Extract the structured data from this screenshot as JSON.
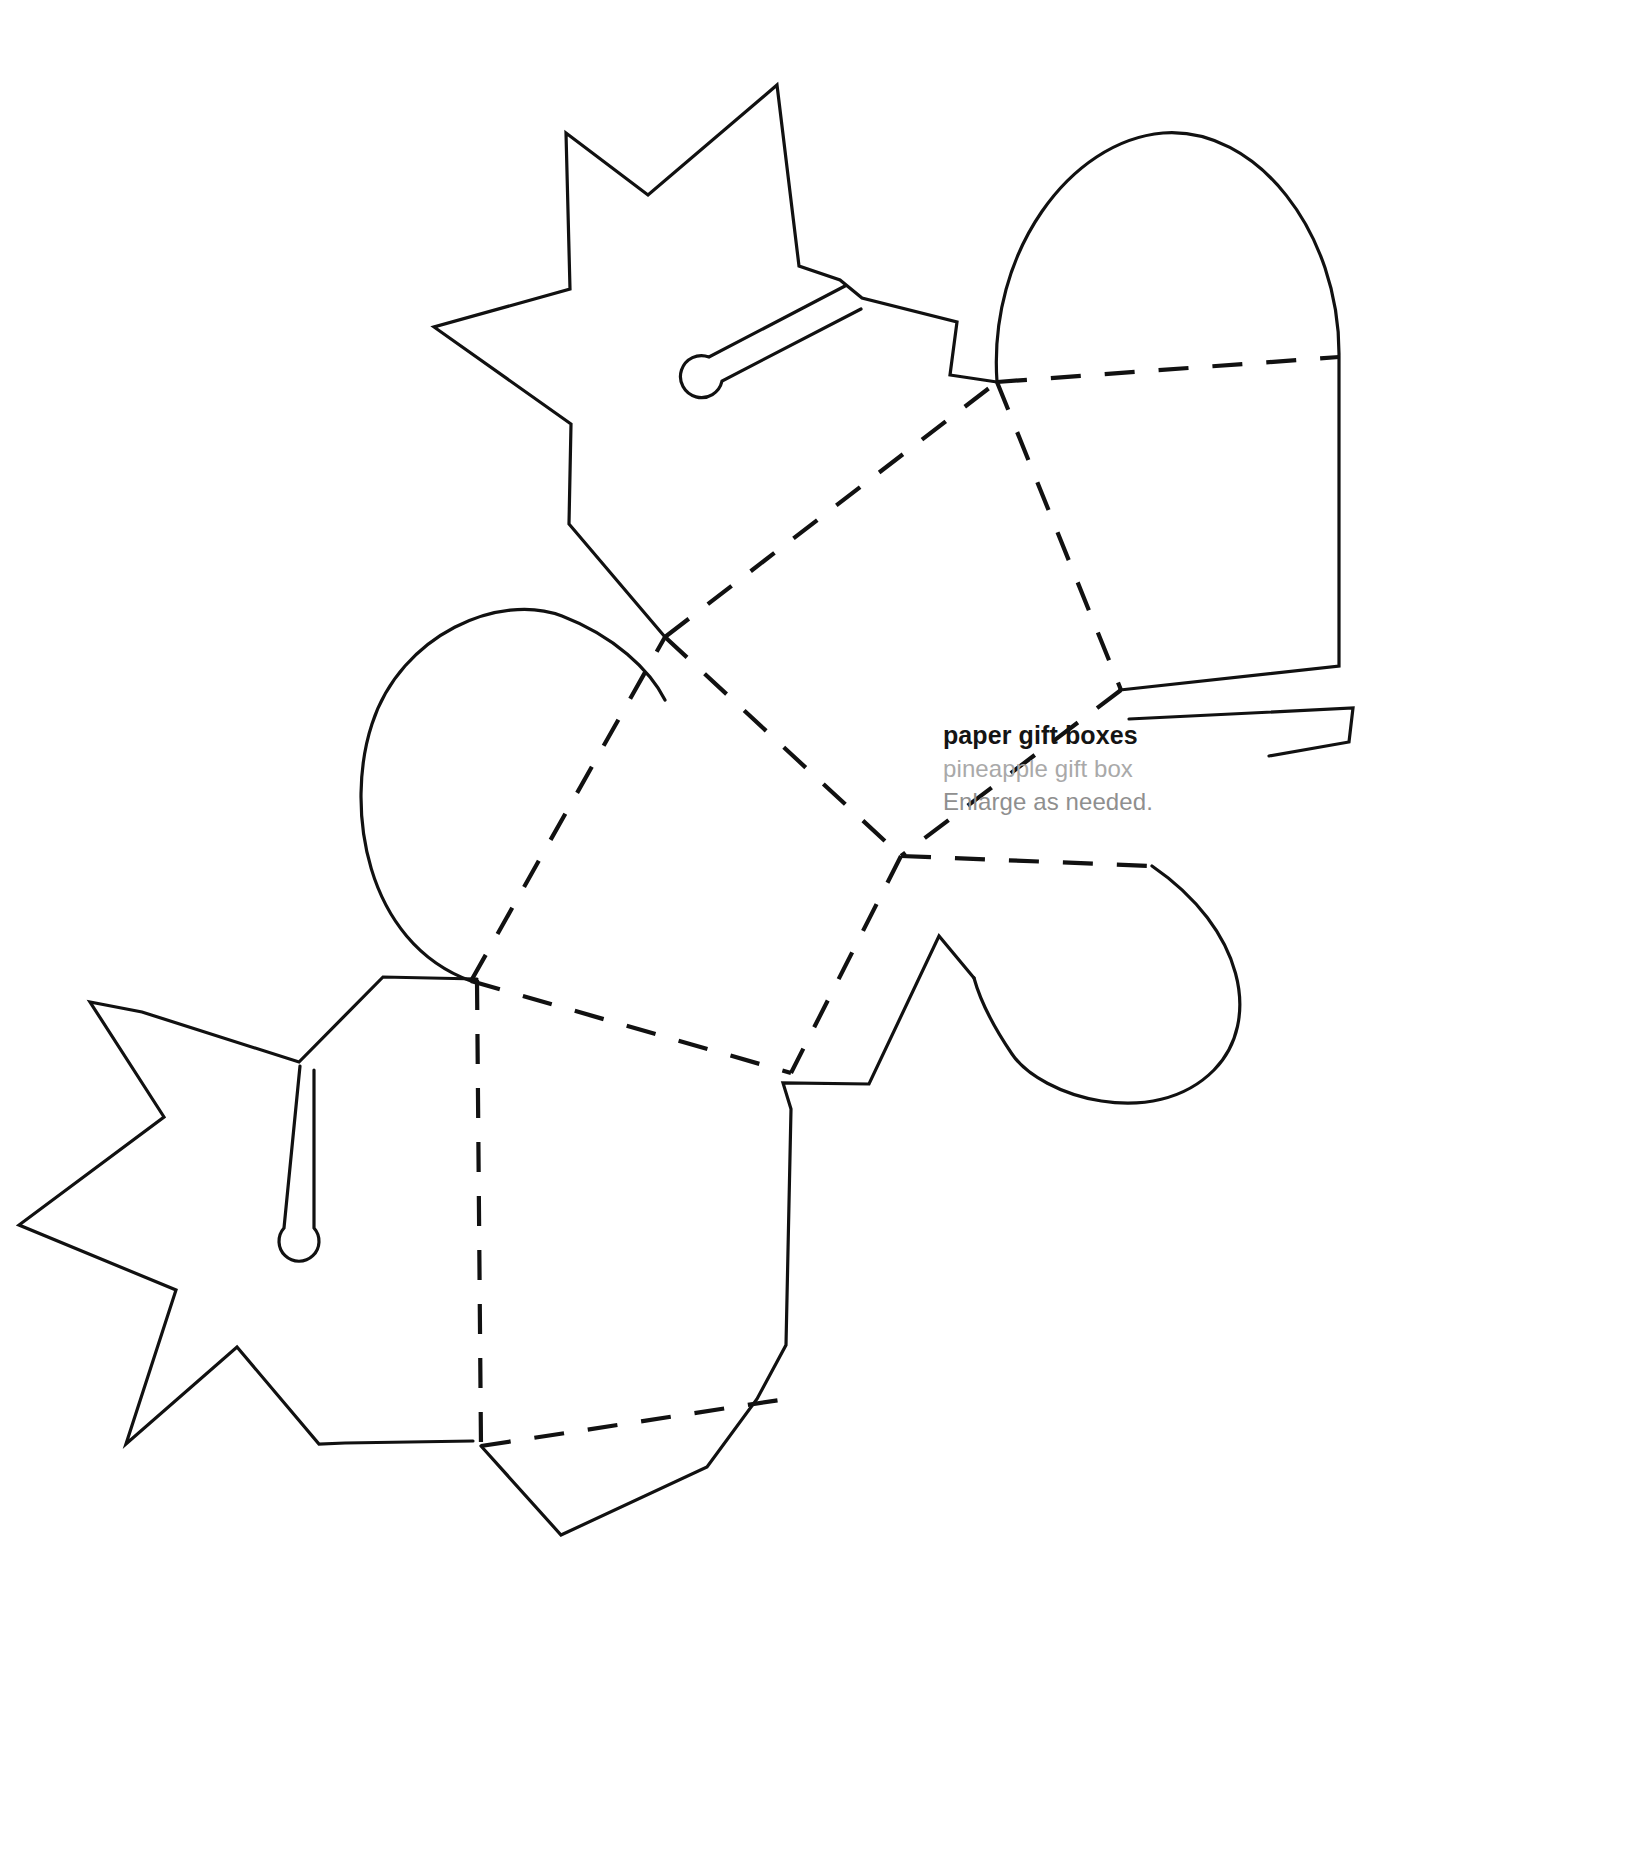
{
  "document": {
    "title": "paper gift boxes",
    "subtitle": "pineapple gift box",
    "note": "Enlarge as needed.",
    "background_color": "#ffffff",
    "ink_color": "#111111",
    "subtitle_color": "#a9a9a9",
    "note_color": "#8f8f8f",
    "type": "printable craft template",
    "page_width": 1638,
    "page_height": 1867
  },
  "legend": {
    "cut_line_style": "solid",
    "fold_line_style": "dashed"
  },
  "pieces": [
    {
      "id": "crown-top",
      "name": "pineapple crown leaves (upper)",
      "line_style": "solid",
      "has_slot": true
    },
    {
      "id": "arch-right",
      "name": "rounded arch flap (upper right)",
      "line_style": "solid",
      "has_slot": false
    },
    {
      "id": "arch-left",
      "name": "rounded arch flap (middle left)",
      "line_style": "solid",
      "has_slot": false
    },
    {
      "id": "arch-lower-right",
      "name": "rounded arch flap (lower right)",
      "line_style": "solid",
      "has_slot": false
    },
    {
      "id": "crown-bottom",
      "name": "pineapple crown leaves (lower)",
      "line_style": "solid",
      "has_slot": true
    },
    {
      "id": "body-panels",
      "name": "box body panels",
      "line_style": "dashed",
      "fold_count": 7
    }
  ],
  "shapes": {
    "crown_top_outline": "M 665,637 L 572,524 L 570,424 L 434,327 L 570,288 L 567,133 L 647,193 L 777,85 L 800,267 L 838,280 L 863,297 L 957,322 L 949,374 L 997,382",
    "crown_top_slot": "M 843,287 L 706,359 A 20,20 0 1 0 716,381 L 860,307",
    "arch_right_outline": "M 997,382 C 991,250 1080,140 1165,133 C 1252,128 1340,235 1338,356 L 1338,666 L 1120,690 L 1130,718 L 1352,707 L 1348,741 L 1270,755",
    "arch_left_outline": "M 470,981 C 365,944 347,812 368,728 C 392,634 492,594 556,614 C 614,632 652,668 665,700",
    "arch_lower_right_outline": "M 1155,869 C 1239,931 1258,1020 1214,1068 C 1158,1130 1043,1099 1012,1057 C 990,1027 978,1000 973,977",
    "crown_bottom_outline": "M 476,979 L 383,977 L 300,1061 L 143,1012 L 90,1003 L 163,1117 L 19,1224 L 175,1290 L 125,1443 L 236,1348 L 318,1444 L 345,1443 L 472,1441",
    "crown_bottom_slot": "M 300,1065 L 285,1225 A 19,19 0 1 0 312,1226 L 312,1069",
    "body_lower_right_tail": "M 973,977 L 938,937 L 870,1084 L 782,1083 L 790,1108 L 785,1345 L 755,1400 L 707,1468 L 560,1535 L 480,1445",
    "fold_top_horizontal": "M 997,382 L 1338,356",
    "fold_diag_a": "M 665,637 L 997,382",
    "fold_diag_b": "M 665,637 L 900,855",
    "fold_diag_c": "M 997,382 L 1120,690",
    "fold_diag_d": "M 1120,690 L 900,855",
    "fold_diag_e": "M 900,855 L 1155,869",
    "fold_diag_f": "M 470,981 L 665,637",
    "fold_diag_g": "M 470,981 L 790,1070",
    "fold_diag_h": "M 900,855 L 790,1070",
    "fold_vertical": "M 476,979 L 480,1445",
    "fold_bottom": "M 480,1445 L 785,1400"
  }
}
